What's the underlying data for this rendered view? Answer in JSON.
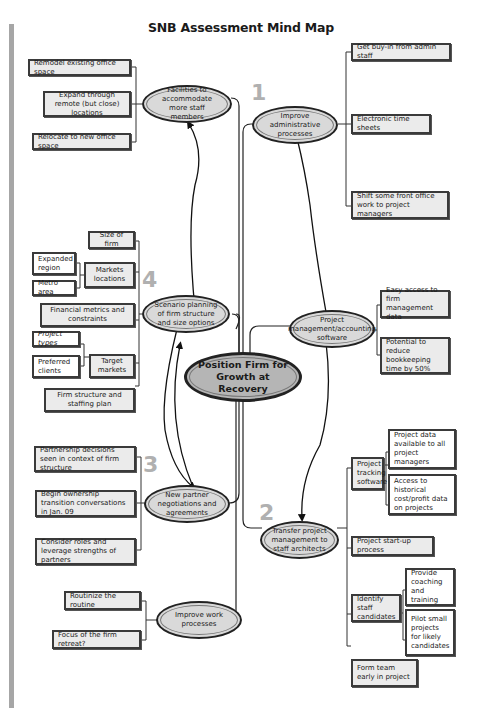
{
  "title": "SNB Assessment Mind Map",
  "center": {
    "label": "Position Firm for Growth at Recovery"
  },
  "numbers": {
    "n1": "1",
    "n2": "2",
    "n3": "3",
    "n4": "4"
  },
  "branches": {
    "facilities": {
      "label": "Facilities to accommodate more staff members",
      "children": [
        "Remodel existing office space",
        "Expand through remote (but close) locations",
        "Relocate to new office space"
      ]
    },
    "admin": {
      "label": "Improve administrative processes",
      "children": [
        "Get buy-in from admin staff",
        "Electronic time sheets",
        "Shift some front office work to project managers"
      ]
    },
    "scenario": {
      "label": "Scenario planning of firm structure and size options",
      "children": [
        {
          "label": "Size of firm"
        },
        {
          "label": "Markets locations",
          "children": [
            "Expanded region",
            "Metro area"
          ]
        },
        {
          "label": "Financial metrics and constraints"
        },
        {
          "label": "Target markets",
          "children": [
            "Project types",
            "Preferred clients"
          ]
        },
        {
          "label": "Firm structure and staffing plan"
        }
      ]
    },
    "software": {
      "label": "Project management/accounting software",
      "children": [
        "Easy access to firm management data",
        "Potential to reduce bookkeeping time by 50%"
      ]
    },
    "partner": {
      "label": "New partner negotiations and agreements",
      "children": [
        "Partnership decisions seen in context of firm structure",
        "Begin ownership transition conversations in Jan. 09",
        "Consider roles and leverage strengths of partners"
      ]
    },
    "transfer": {
      "label": "Transfer project management to staff architects",
      "children": [
        {
          "label": "Project tracking software",
          "children": [
            "Project data available to all project managers",
            "Access to historical cost/profit data on projects"
          ]
        },
        {
          "label": "Project start-up process"
        },
        {
          "label": "Identify staff candidates",
          "children": [
            "Provide coaching and training",
            "Pilot small projects for likely candidates"
          ]
        },
        {
          "label": "Form team early in project"
        }
      ]
    },
    "work": {
      "label": "Improve work processes",
      "children": [
        "Routinize the routine",
        "Focus of the firm retreat?"
      ]
    }
  },
  "colors": {
    "box_fill": "#ebebeb",
    "leaf_fill": "#ffffff",
    "ellipse_fill": "#d9d9d9",
    "center_fill": "#b5b5b5",
    "number_color": "#b0b0b0",
    "sidebar_bar": "#a6a6a6"
  }
}
